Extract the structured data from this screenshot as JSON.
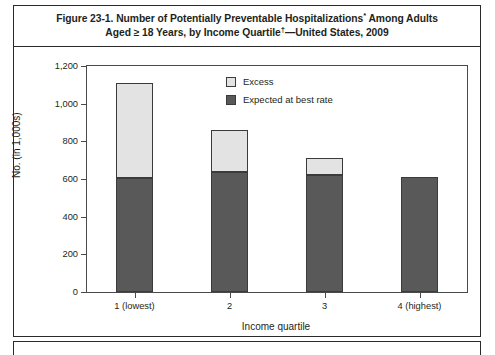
{
  "figure": {
    "title_line1": "Figure 23-1. Number of Potentially Preventable Hospitalizations",
    "title_sup1": "*",
    "title_line1b": " Among Adults",
    "title_line2": "Aged ≥ 18 Years, by Income Quartile",
    "title_sup2": "†",
    "title_line2b": "—United States, 2009"
  },
  "colors": {
    "excess": "#e3e3e3",
    "expected": "#595959",
    "axis": "#4a4a4a",
    "frame": "#2a2a2a",
    "text": "#231f20"
  },
  "chart_data": {
    "type": "bar",
    "stacked": true,
    "title": "Figure 23-1. Number of Potentially Preventable Hospitalizations* Among Adults Aged ≥ 18 Years, by Income Quartile†—United States, 2009",
    "xlabel": "Income quartile",
    "ylabel": "No. (in 1,000s)",
    "categories": [
      "1 (lowest)",
      "2",
      "3",
      "4 (highest)"
    ],
    "ylim": [
      0,
      1200
    ],
    "yticks": [
      0,
      200,
      400,
      600,
      800,
      1000,
      1200
    ],
    "ytick_labels": [
      "0",
      "200",
      "400",
      "600",
      "800",
      "1,000",
      "1,200"
    ],
    "grid": false,
    "legend_position": "upper-center-right",
    "series": [
      {
        "name": "Expected at best rate",
        "color": "#595959",
        "values": [
          605,
          635,
          620,
          610
        ]
      },
      {
        "name": "Excess",
        "color": "#e3e3e3",
        "values": [
          505,
          225,
          90,
          0
        ]
      }
    ],
    "totals": [
      1110,
      860,
      710,
      610
    ]
  }
}
